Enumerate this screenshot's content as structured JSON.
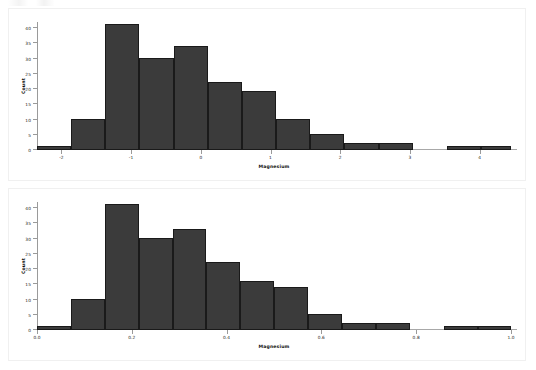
{
  "figure": {
    "background_color": "#ffffff",
    "panel_border_color": "#f0f0f0",
    "bar_fill_color": "#3b3b3b",
    "bar_edge_color": "#1a1a1a",
    "axis_color": "#9a9a9a",
    "panel_count": 2
  },
  "chart_data": [
    {
      "id": "magnesium-raw",
      "type": "bar",
      "title": "",
      "subtitle": "",
      "xlabel": "Magnesium",
      "ylabel": "Count",
      "xlim": [
        -2.35,
        4.45
      ],
      "ylim": [
        0,
        42
      ],
      "xticks": [
        -2,
        -1,
        0,
        1,
        2,
        3,
        4
      ],
      "xtick_labels": [
        "-2",
        "-1",
        "0",
        "1",
        "2",
        "3",
        "4"
      ],
      "yticks": [
        0,
        5,
        10,
        15,
        20,
        25,
        30,
        35,
        40
      ],
      "ytick_labels": [
        "0",
        "5",
        "10",
        "15",
        "20",
        "25",
        "30",
        "35",
        "40"
      ],
      "grid": false,
      "legend": false,
      "bin_edges": [
        -2.35,
        -1.86,
        -1.37,
        -0.88,
        -0.39,
        0.1,
        0.59,
        1.08,
        1.57,
        2.06,
        2.55,
        3.04,
        3.53,
        4.02,
        4.45
      ],
      "categories": [
        "-2.35..-1.86",
        "-1.86..-1.37",
        "-1.37..-0.88",
        "-0.88..-0.39",
        "-0.39..0.10",
        "0.10..0.59",
        "0.59..1.08",
        "1.08..1.57",
        "1.57..2.06",
        "2.06..2.55",
        "2.55..3.04",
        "3.04..3.53",
        "3.53..4.02",
        "4.02..4.45"
      ],
      "values": [
        1,
        10,
        41,
        30,
        34,
        22,
        19,
        10,
        5,
        2,
        2,
        0,
        1,
        1
      ]
    },
    {
      "id": "magnesium-normalized",
      "type": "bar",
      "title": "",
      "subtitle": "",
      "xlabel": "Magnesium",
      "ylabel": "Count",
      "xlim": [
        0.0,
        1.0
      ],
      "ylim": [
        0,
        42
      ],
      "xticks": [
        0.0,
        0.2,
        0.4,
        0.6,
        0.8,
        1.0
      ],
      "xtick_labels": [
        "0.0",
        "0.2",
        "0.4",
        "0.6",
        "0.8",
        "1.0"
      ],
      "yticks": [
        0,
        5,
        10,
        15,
        20,
        25,
        30,
        35,
        40
      ],
      "ytick_labels": [
        "0",
        "5",
        "10",
        "15",
        "20",
        "25",
        "30",
        "35",
        "40"
      ],
      "grid": false,
      "legend": false,
      "bin_edges": [
        0.0,
        0.0715,
        0.143,
        0.2145,
        0.286,
        0.3575,
        0.429,
        0.5005,
        0.572,
        0.6435,
        0.715,
        0.7865,
        0.858,
        0.9295,
        1.0
      ],
      "categories": [
        "0.000..0.071",
        "0.071..0.143",
        "0.143..0.214",
        "0.214..0.286",
        "0.286..0.357",
        "0.357..0.429",
        "0.429..0.501",
        "0.501..0.572",
        "0.572..0.643",
        "0.643..0.715",
        "0.715..0.786",
        "0.786..0.858",
        "0.858..0.930",
        "0.930..1.000"
      ],
      "values": [
        1,
        10,
        41,
        30,
        33,
        22,
        16,
        14,
        5,
        2,
        2,
        0,
        1,
        1
      ]
    }
  ]
}
